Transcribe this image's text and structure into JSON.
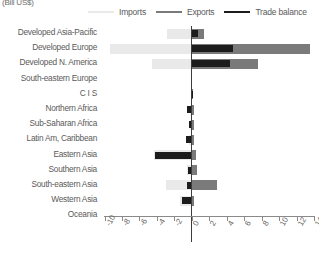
{
  "units_label": "(Bill US$)",
  "legend": {
    "position": "top",
    "entries": [
      {
        "label": "Imports",
        "color": "#e9e9e9",
        "name": "legend-imports"
      },
      {
        "label": "Exports",
        "color": "#7a7a7a",
        "name": "legend-exports"
      },
      {
        "label": "Trade balance",
        "color": "#1c1c1c",
        "name": "legend-trade-balance"
      }
    ]
  },
  "chart_data": {
    "type": "bar",
    "orientation": "horizontal",
    "title": "",
    "subtitle": "",
    "xlabel": "(Bill US$)",
    "ylabel": "",
    "grid": false,
    "legend_position": "top",
    "xlim": [
      -10,
      14
    ],
    "xticks": [
      -10,
      -8,
      -6,
      -4,
      -2,
      0,
      2,
      4,
      6,
      8,
      10,
      12,
      14
    ],
    "xtick_labels": [
      "-10",
      "-8",
      "-6",
      "-4",
      "-2",
      "0",
      "2",
      "4",
      "6",
      "8",
      "10",
      "12",
      "14"
    ],
    "categories": [
      "Developed Asia-Pacific",
      "Developed Europe",
      "Developed N. America",
      "South-eastern Europe",
      "C I S",
      "Northern Africa",
      "Sub-Saharan Africa",
      "Latin Am, Caribbean",
      "Eastern Asia",
      "Southern Asia",
      "South-eastern Asia",
      "Western Asia",
      "Oceania"
    ],
    "series": [
      {
        "name": "Imports",
        "color": "#e9e9e9",
        "values": [
          -2.8,
          -9.4,
          -4.6,
          0.0,
          -0.1,
          -0.2,
          -0.2,
          -0.3,
          -4.3,
          -0.6,
          -3.0,
          -1.3,
          0.0
        ]
      },
      {
        "name": "Exports",
        "color": "#7a7a7a",
        "values": [
          1.4,
          13.6,
          7.6,
          0.0,
          0.1,
          0.2,
          0.2,
          0.3,
          0.5,
          0.6,
          2.9,
          0.2,
          0.0
        ]
      },
      {
        "name": "Trade balance",
        "color": "#1c1c1c",
        "values": [
          0.7,
          4.7,
          4.4,
          0.0,
          0.1,
          -0.6,
          -0.3,
          -0.7,
          -4.2,
          -0.4,
          -0.5,
          -1.1,
          0.0
        ]
      }
    ]
  }
}
